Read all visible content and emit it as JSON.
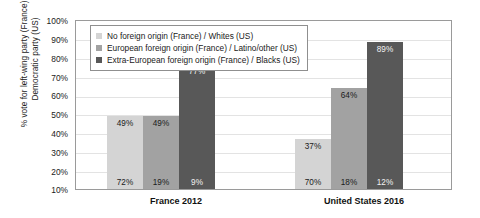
{
  "chart_data": {
    "type": "bar",
    "title": "",
    "xlabel": "",
    "ylabel": "% vote for left-wing party (France) or Democratic party (US)",
    "ylabel_lines": [
      "% vote for left-wing party (France) or",
      "Democratic party (US)"
    ],
    "categories": [
      "France 2012",
      "United States 2016"
    ],
    "ylim": [
      10,
      100
    ],
    "ytick_labels": [
      "100%",
      "90%",
      "80%",
      "70%",
      "60%",
      "50%",
      "40%",
      "30%",
      "20%",
      "10%"
    ],
    "ytick_values": [
      100,
      90,
      80,
      70,
      60,
      50,
      40,
      30,
      20,
      10
    ],
    "grid": true,
    "legend_position": "top-left-inside",
    "series": [
      {
        "name": "No foreign origin (France) / Whites (US)",
        "color": "#d4d4d4",
        "values": [
          49,
          37
        ],
        "value_labels": [
          "49%",
          "37%"
        ],
        "share_labels": [
          "72%",
          "70%"
        ],
        "shares": [
          72,
          70
        ]
      },
      {
        "name": "European foreign origin (France) / Latino/other (US)",
        "color": "#a2a2a2",
        "values": [
          49,
          64
        ],
        "value_labels": [
          "49%",
          "64%"
        ],
        "share_labels": [
          "19%",
          "18%"
        ],
        "shares": [
          19,
          18
        ]
      },
      {
        "name": "Extra-European foreign origin (France) / Blacks (US)",
        "color": "#585858",
        "values": [
          77,
          89
        ],
        "value_labels": [
          "77%",
          "89%"
        ],
        "share_labels": [
          "9%",
          "12%"
        ],
        "shares": [
          9,
          12
        ]
      }
    ]
  }
}
